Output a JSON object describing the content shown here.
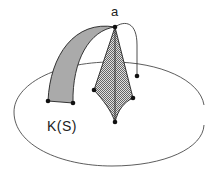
{
  "diagram": {
    "labels": {
      "apex": "a",
      "region": "K(S)"
    },
    "colors": {
      "stroke": "#222222",
      "arch_fill": "#a9a9a9",
      "kite_fill": "#bdbdbd",
      "background": "#ffffff"
    },
    "points": {
      "apex": [
        115,
        27
      ],
      "arch_base_left": [
        48,
        101
      ],
      "arch_base_right": [
        73,
        103
      ],
      "kite_left": [
        94,
        90
      ],
      "kite_right": [
        133,
        98
      ],
      "kite_bottom": [
        115,
        122
      ],
      "curve_end": [
        137,
        76
      ]
    }
  }
}
